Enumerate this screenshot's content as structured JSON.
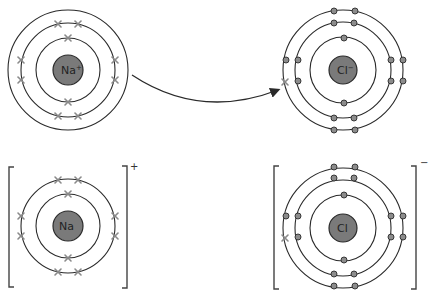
{
  "diagram": {
    "top_row": {
      "sodium": {
        "symbol": "Na",
        "charge_superscript": "+",
        "label": "Na+",
        "shells": [
          2,
          8,
          1
        ],
        "electron_marker": "cross"
      },
      "chlorine": {
        "symbol": "Cl",
        "charge_superscript": "−",
        "label": "Cl−",
        "shells": [
          2,
          8,
          7
        ],
        "electron_marker": "dot",
        "transferred_electron_marker": "cross"
      },
      "arrow": {
        "from": "sodium outer electron",
        "to": "chlorine outer shell",
        "meaning": "electron transfer"
      }
    },
    "bottom_row": {
      "sodium_ion": {
        "symbol": "Na",
        "bracket_charge": "+",
        "shells": [
          2,
          8
        ]
      },
      "chloride_ion": {
        "symbol": "Cl",
        "bracket_charge": "−",
        "shells": [
          2,
          8,
          8
        ],
        "transferred_electron_marker": "cross"
      }
    }
  }
}
